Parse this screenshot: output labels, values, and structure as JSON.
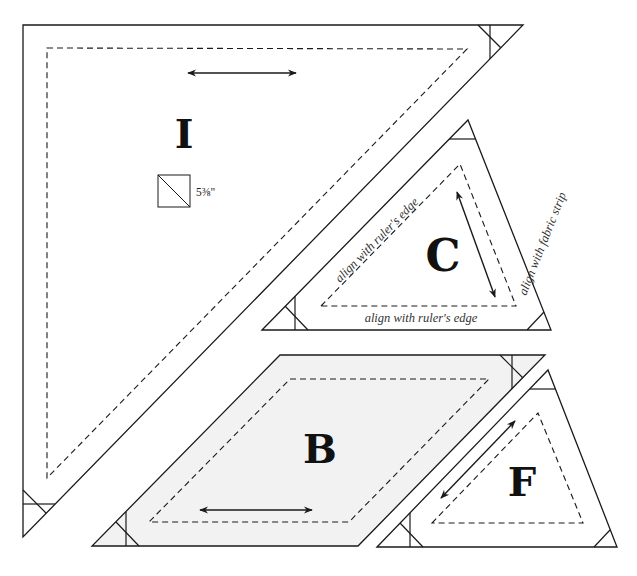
{
  "colors": {
    "line": "#1a1a1a",
    "background": "#ffffff",
    "piece_b_fill": "#f2f2f2",
    "guide_text": "#333333"
  },
  "pieces": {
    "I": {
      "label": "I",
      "size_label": "5⅜\"",
      "size_icon": "half-square-triangle-icon",
      "grain_arrow": "double-arrow-horizontal"
    },
    "C": {
      "label": "C",
      "guides": {
        "hypotenuse": "align with ruler's edge",
        "base": "align with ruler's edge",
        "right_side": "align with fabric strip"
      },
      "grain_arrow": "double-arrow-diagonal"
    },
    "B": {
      "label": "B",
      "grain_arrow": "double-arrow-horizontal"
    },
    "F": {
      "label": "F",
      "grain_arrow": "double-arrow-diagonal"
    }
  }
}
